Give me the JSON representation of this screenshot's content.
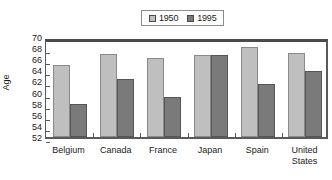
{
  "chart_data": {
    "type": "bar",
    "title": "",
    "xlabel": "",
    "ylabel": "Age",
    "ylim": [
      52,
      70
    ],
    "ytick_step": 2,
    "yticks": [
      70,
      68,
      66,
      64,
      62,
      60,
      58,
      56,
      54,
      52
    ],
    "grid": false,
    "legend_position": "top-center",
    "categories": [
      "Belgium",
      "Canada",
      "France",
      "Japan",
      "Spain",
      "United\nStates"
    ],
    "series": [
      {
        "name": "1950",
        "color": "#bfbfbf",
        "values": [
          65.0,
          67.0,
          66.2,
          66.8,
          68.2,
          67.2
        ]
      },
      {
        "name": "1995",
        "color": "#7a7a7a",
        "values": [
          57.9,
          62.4,
          59.2,
          66.8,
          61.5,
          63.8
        ]
      }
    ]
  },
  "legend": {
    "entries": [
      {
        "label": "1950",
        "swatch": "legend-swatch-1950"
      },
      {
        "label": "1995",
        "swatch": "legend-swatch-1995"
      }
    ]
  }
}
